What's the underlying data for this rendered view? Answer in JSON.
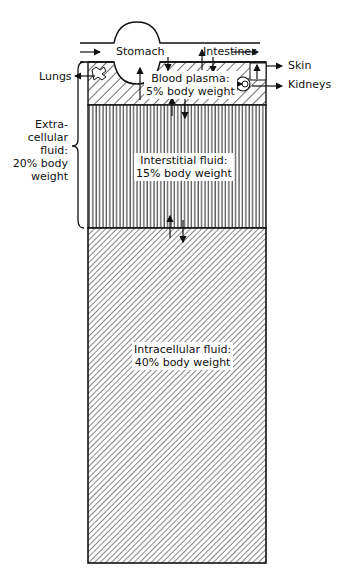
{
  "diagram": {
    "compartments": [
      {
        "name": "Blood plasma",
        "label_line1": "Blood plasma:",
        "label_line2": "5% body weight",
        "percent": 5,
        "pattern": "diagonal-wide"
      },
      {
        "name": "Interstitial fluid",
        "label_line1": "Interstitial fluid:",
        "label_line2": "15% body weight",
        "percent": 15,
        "pattern": "vertical"
      },
      {
        "name": "Intracellular fluid",
        "label_line1": "Intracellular fluid:",
        "label_line2": "40% body weight",
        "percent": 40,
        "pattern": "diagonal-fine"
      }
    ],
    "extracellular": {
      "line1": "Extra-",
      "line2": "cellular",
      "line3": "fluid:",
      "line4": "20% body",
      "line5": "weight",
      "percent": 20
    },
    "organs": {
      "stomach": "Stomach",
      "intestines": "Intestines",
      "lungs": "Lungs",
      "skin": "Skin",
      "kidneys": "Kidneys"
    }
  }
}
